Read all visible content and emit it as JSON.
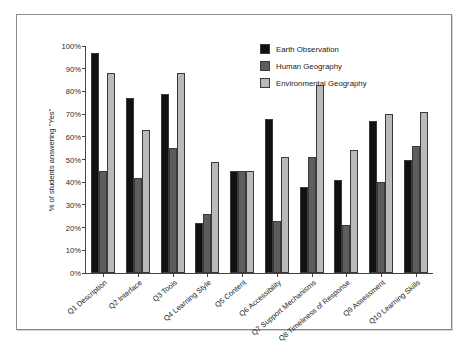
{
  "top_text": "",
  "chart_data": {
    "type": "bar",
    "title": "",
    "xlabel": "",
    "ylabel": "% of students answering \"Yes\"",
    "ylim": [
      0,
      100
    ],
    "ytick_labels": [
      "100%",
      "90%",
      "80%",
      "70%",
      "60%",
      "50%",
      "40%",
      "30%",
      "20%",
      "10%",
      "0%"
    ],
    "ytick_values": [
      100,
      90,
      80,
      70,
      60,
      50,
      40,
      30,
      20,
      10,
      0
    ],
    "grid": false,
    "legend_position": "top-right",
    "categories": [
      "Q1 Description",
      "Q2 Interface",
      "Q3 Tools",
      "Q4 Learning Style",
      "Q5 Content",
      "Q6 Accessibility",
      "Q7 Support Mechanisms",
      "Q8 Timeliness of Response",
      "Q9 Assessment",
      "Q10 Learning Skills"
    ],
    "series": [
      {
        "name": "Earth Observation",
        "color": "#111111",
        "values": [
          97,
          77,
          79,
          22,
          45,
          68,
          38,
          41,
          67,
          50
        ]
      },
      {
        "name": "Human Geography",
        "color": "#5d5d5d",
        "values": [
          45,
          42,
          55,
          26,
          45,
          23,
          51,
          21,
          40,
          56
        ]
      },
      {
        "name": "Environmental Geography",
        "color": "#b9b9b9",
        "values": [
          88,
          63,
          88,
          49,
          45,
          51,
          83,
          54,
          70,
          71
        ]
      }
    ]
  }
}
